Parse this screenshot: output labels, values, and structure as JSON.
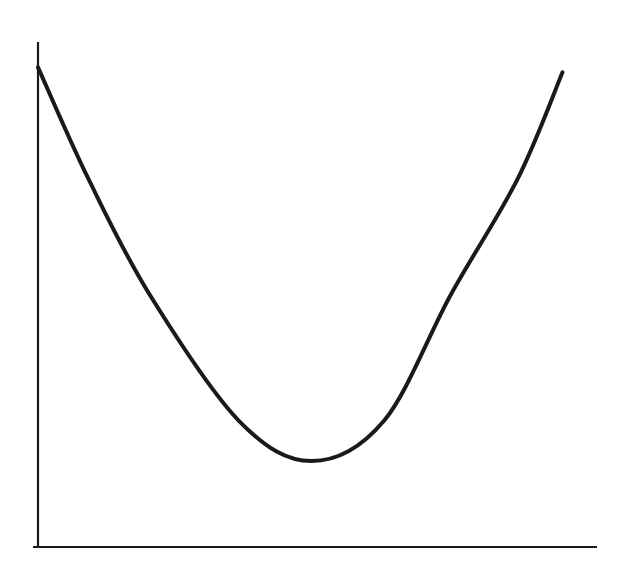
{
  "chart_data": {
    "type": "line",
    "title": "",
    "xlabel": "",
    "ylabel": "",
    "grid": false,
    "legend": null,
    "xlim": [
      0,
      100
    ],
    "ylim": [
      0,
      100
    ],
    "series": [
      {
        "name": "U-shaped curve",
        "color": "#1a1a1a",
        "x": [
          0,
          9,
          20,
          36,
          49,
          62,
          74,
          86,
          94
        ],
        "y": [
          95,
          73,
          50,
          25,
          17,
          25,
          50,
          73,
          94
        ]
      }
    ],
    "annotations": [],
    "minimum": {
      "x": 49,
      "y": 17
    }
  },
  "style": {
    "axis_color": "#1a1a1a",
    "line_color": "#1a1a1a",
    "background": "#ffffff"
  }
}
